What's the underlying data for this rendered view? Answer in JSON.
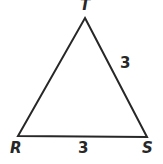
{
  "figure": {
    "type": "geometry-diagram",
    "shape": "triangle",
    "background_color": "#ffffff",
    "stroke_color": "#272727",
    "stroke_width": 2,
    "width": 163,
    "height": 164,
    "vertices": [
      {
        "name": "T",
        "label": "T",
        "x": 85,
        "y": 18,
        "position": "apex"
      },
      {
        "name": "R",
        "label": "R",
        "x": 18,
        "y": 136,
        "position": "bottom-left"
      },
      {
        "name": "S",
        "label": "S",
        "x": 147,
        "y": 137,
        "position": "bottom-right"
      }
    ],
    "sides": [
      {
        "name": "RT",
        "from": "R",
        "to": "T",
        "label": ""
      },
      {
        "name": "TS",
        "from": "T",
        "to": "S",
        "label": "3"
      },
      {
        "name": "RS",
        "from": "R",
        "to": "S",
        "label": "3"
      }
    ],
    "labels": {
      "vertex_T": "T",
      "vertex_R": "R",
      "vertex_S": "S",
      "side_TS_length": "3",
      "side_RS_length": "3"
    }
  }
}
